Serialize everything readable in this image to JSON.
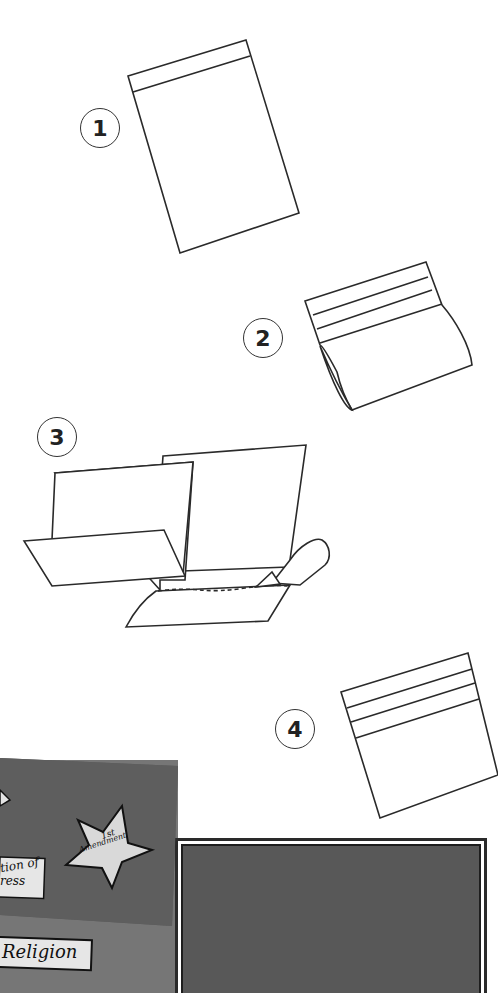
{
  "steps": [
    {
      "number": "1",
      "description": "Flat sheet with top fold line"
    },
    {
      "number": "2",
      "description": "Sheet folded with multiple top folds, bottom rolled"
    },
    {
      "number": "3",
      "description": "Folded sheets glued together with glue bottle"
    },
    {
      "number": "4",
      "description": "Finished folded pocket with three fold lines"
    }
  ],
  "photo": {
    "star_label_line1": "1st",
    "star_label_line2": "Amendment",
    "card_label_1_line1": "tion of",
    "card_label_1_line2": "ress",
    "card_label_2": "Religion"
  },
  "colors": {
    "line": "#2a2a2a",
    "board_dark": "#5a5a5a",
    "board_mid": "#6e6e6e",
    "board_light": "#8a8a8a",
    "label_bg": "#e4e4e4"
  }
}
